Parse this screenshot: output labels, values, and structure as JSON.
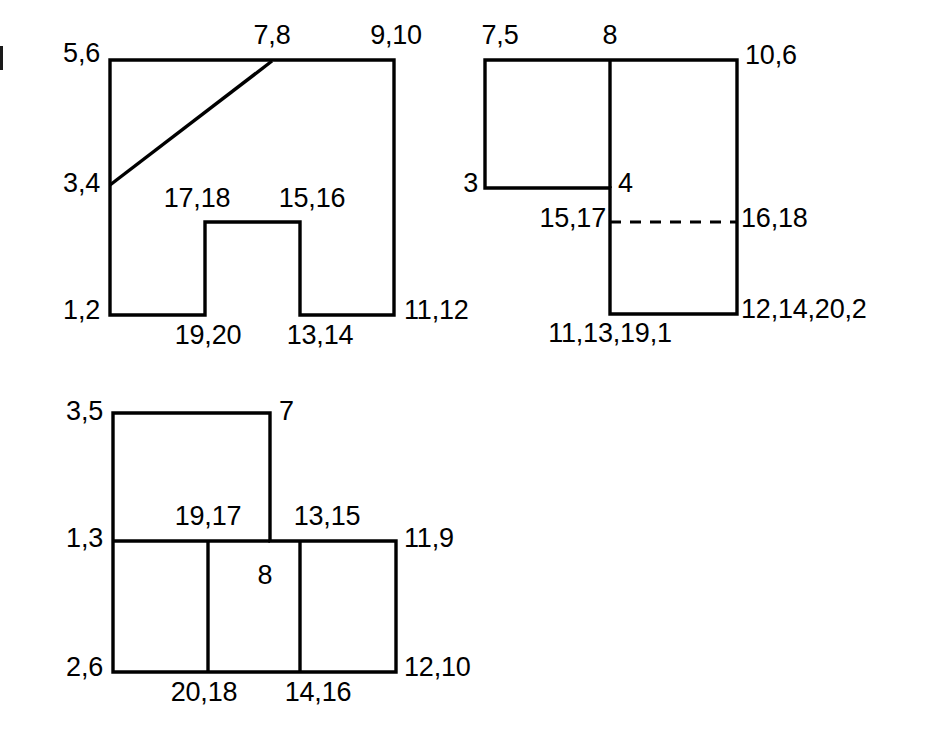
{
  "document": {
    "type": "line-drawing",
    "description": "Three outline polygon figures annotated with numbered vertex/edge labels",
    "stroke_color": "#000000",
    "background_color": "#ffffff",
    "stroke_width": 3
  },
  "figures": [
    {
      "id": "figure-top-left",
      "name": "notched-rectangle-with-diagonal",
      "labels": {
        "top_left": "5,6",
        "top_mid": "7,8",
        "top_right": "9,10",
        "left_mid": "3,4",
        "notch_left": "17,18",
        "notch_right": "15,16",
        "bottom_left": "1,2",
        "bottom_mid_left": "19,20",
        "bottom_mid_right": "13,14",
        "bottom_right": "11,12"
      }
    },
    {
      "id": "figure-top-right",
      "name": "stepped-rectangle-with-dashed-line",
      "labels": {
        "top_left": "7,5",
        "top_mid": "8",
        "top_right": "10,6",
        "left_lower": "3",
        "mid_marker": "4",
        "dash_left": "15,17",
        "dash_right": "16,18",
        "bottom_left": "11,13,19,1",
        "bottom_right": "12,14,20,2"
      }
    },
    {
      "id": "figure-bottom",
      "name": "t-shaped-subdivided-rectangle",
      "labels": {
        "top_left": "3,5",
        "top_right": "7",
        "mid_left": "1,3",
        "mid_label_left": "19,17",
        "mid_label_right": "13,15",
        "mid_right": "11,9",
        "center": "8",
        "bottom_left": "2,6",
        "bottom_mid_left": "20,18",
        "bottom_mid_right": "14,16",
        "bottom_right": "12,10"
      }
    }
  ]
}
